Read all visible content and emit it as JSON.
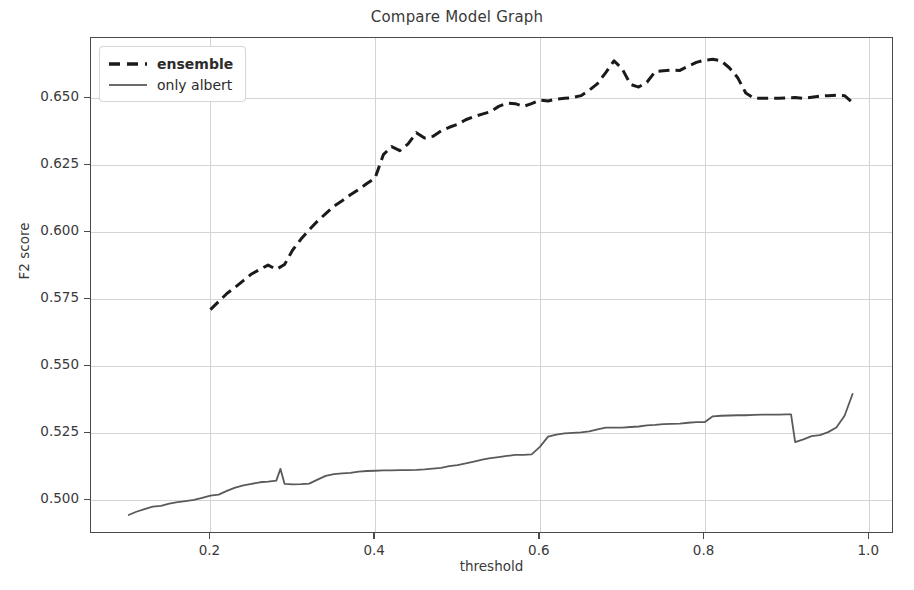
{
  "chart_data": {
    "type": "line",
    "title": "Compare Model Graph",
    "xlabel": "threshold",
    "ylabel": "F2 score",
    "xlim": [
      0.055,
      1.03
    ],
    "ylim": [
      0.4875,
      0.6725
    ],
    "xticks": [
      0.2,
      0.4,
      0.6,
      0.8,
      1.0
    ],
    "xtick_labels": [
      "0.2",
      "0.4",
      "0.6",
      "0.8",
      "1.0"
    ],
    "yticks": [
      0.5,
      0.525,
      0.55,
      0.575,
      0.6,
      0.625,
      0.65
    ],
    "ytick_labels": [
      "0.500",
      "0.525",
      "0.550",
      "0.575",
      "0.600",
      "0.625",
      "0.650"
    ],
    "grid": true,
    "legend_position": "upper left",
    "series": [
      {
        "name": "ensemble",
        "style": "dashed",
        "color": "#1a1a1a",
        "linewidth": 3.0,
        "x": [
          0.2,
          0.21,
          0.22,
          0.23,
          0.24,
          0.25,
          0.26,
          0.27,
          0.28,
          0.29,
          0.3,
          0.31,
          0.32,
          0.33,
          0.34,
          0.35,
          0.36,
          0.37,
          0.38,
          0.39,
          0.4,
          0.41,
          0.42,
          0.43,
          0.44,
          0.45,
          0.46,
          0.47,
          0.48,
          0.49,
          0.5,
          0.51,
          0.52,
          0.53,
          0.54,
          0.55,
          0.56,
          0.57,
          0.58,
          0.59,
          0.6,
          0.61,
          0.62,
          0.63,
          0.64,
          0.65,
          0.66,
          0.67,
          0.68,
          0.69,
          0.7,
          0.71,
          0.72,
          0.73,
          0.74,
          0.75,
          0.76,
          0.77,
          0.78,
          0.79,
          0.8,
          0.81,
          0.82,
          0.83,
          0.84,
          0.85,
          0.86,
          0.87,
          0.88,
          0.89,
          0.9,
          0.91,
          0.92,
          0.93,
          0.94,
          0.95,
          0.96,
          0.97,
          0.98
        ],
        "y": [
          0.5712,
          0.5742,
          0.5772,
          0.5795,
          0.582,
          0.5845,
          0.5862,
          0.5878,
          0.5862,
          0.588,
          0.5935,
          0.5975,
          0.601,
          0.6042,
          0.607,
          0.6098,
          0.6118,
          0.614,
          0.616,
          0.6182,
          0.6203,
          0.629,
          0.632,
          0.6305,
          0.633,
          0.6372,
          0.6352,
          0.6358,
          0.6378,
          0.6392,
          0.6403,
          0.642,
          0.6432,
          0.6441,
          0.645,
          0.647,
          0.6482,
          0.648,
          0.647,
          0.648,
          0.6493,
          0.649,
          0.6497,
          0.65,
          0.6503,
          0.651,
          0.653,
          0.6555,
          0.6596,
          0.664,
          0.661,
          0.6552,
          0.6542,
          0.656,
          0.66,
          0.6603,
          0.6605,
          0.6604,
          0.662,
          0.6634,
          0.6642,
          0.6646,
          0.664,
          0.6614,
          0.6578,
          0.652,
          0.65,
          0.65,
          0.65,
          0.65,
          0.6502,
          0.6503,
          0.65,
          0.6504,
          0.6508,
          0.651,
          0.6512,
          0.651,
          0.6483
        ]
      },
      {
        "name": "only albert",
        "style": "solid",
        "color": "#5a5a5a",
        "linewidth": 1.8,
        "x": [
          0.1,
          0.11,
          0.12,
          0.13,
          0.14,
          0.15,
          0.16,
          0.17,
          0.18,
          0.19,
          0.2,
          0.21,
          0.22,
          0.23,
          0.24,
          0.25,
          0.26,
          0.27,
          0.28,
          0.285,
          0.29,
          0.3,
          0.31,
          0.32,
          0.33,
          0.34,
          0.35,
          0.36,
          0.37,
          0.38,
          0.39,
          0.4,
          0.41,
          0.42,
          0.43,
          0.44,
          0.45,
          0.46,
          0.47,
          0.48,
          0.49,
          0.5,
          0.51,
          0.52,
          0.53,
          0.54,
          0.55,
          0.56,
          0.57,
          0.58,
          0.59,
          0.6,
          0.61,
          0.62,
          0.63,
          0.64,
          0.65,
          0.66,
          0.67,
          0.68,
          0.69,
          0.7,
          0.71,
          0.72,
          0.73,
          0.74,
          0.75,
          0.76,
          0.77,
          0.78,
          0.79,
          0.8,
          0.81,
          0.82,
          0.83,
          0.84,
          0.85,
          0.86,
          0.87,
          0.88,
          0.89,
          0.9,
          0.905,
          0.91,
          0.92,
          0.93,
          0.94,
          0.95,
          0.96,
          0.97,
          0.98
        ],
        "y": [
          0.4945,
          0.4958,
          0.4968,
          0.4977,
          0.498,
          0.4988,
          0.4994,
          0.4998,
          0.5002,
          0.501,
          0.5018,
          0.5022,
          0.5036,
          0.5048,
          0.5056,
          0.5062,
          0.5068,
          0.507,
          0.5074,
          0.5118,
          0.5062,
          0.506,
          0.5061,
          0.5063,
          0.5078,
          0.5092,
          0.5098,
          0.5101,
          0.5103,
          0.5108,
          0.511,
          0.5111,
          0.5112,
          0.5112,
          0.5113,
          0.5113,
          0.5114,
          0.5116,
          0.5119,
          0.5122,
          0.5128,
          0.5132,
          0.5138,
          0.5145,
          0.5152,
          0.5158,
          0.5162,
          0.5166,
          0.517,
          0.517,
          0.5172,
          0.52,
          0.5238,
          0.5246,
          0.525,
          0.5252,
          0.5254,
          0.5258,
          0.5265,
          0.5272,
          0.5272,
          0.5272,
          0.5274,
          0.5276,
          0.528,
          0.5282,
          0.5285,
          0.5286,
          0.5287,
          0.529,
          0.5292,
          0.5292,
          0.5314,
          0.5316,
          0.5317,
          0.5318,
          0.5318,
          0.5319,
          0.532,
          0.532,
          0.532,
          0.5321,
          0.5321,
          0.5218,
          0.5228,
          0.524,
          0.5244,
          0.5255,
          0.5272,
          0.5316,
          0.54
        ]
      }
    ]
  },
  "legend": {
    "items": [
      {
        "label": "ensemble",
        "style": "dashed"
      },
      {
        "label": "only albert",
        "style": "solid"
      }
    ]
  },
  "colors": {
    "ensemble": "#1a1a1a",
    "only_albert": "#5a5a5a",
    "grid": "#d4d4d4",
    "axis": "#4a4a4a",
    "background": "#ffffff"
  }
}
